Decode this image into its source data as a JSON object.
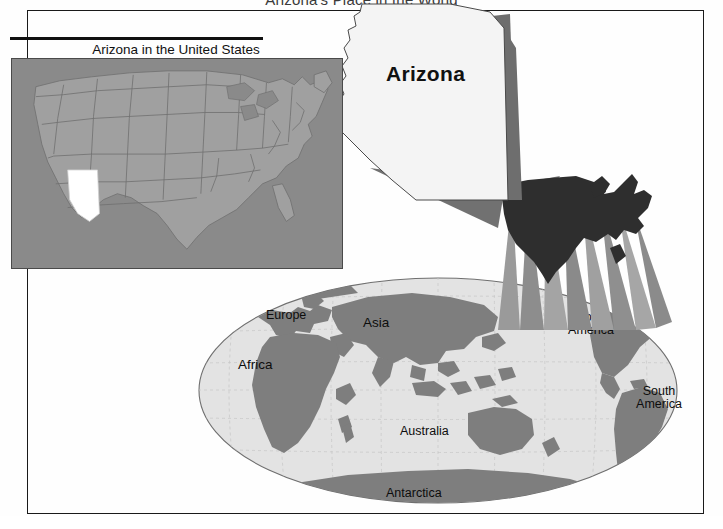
{
  "figure": {
    "title": "Arizona's Place in the World",
    "type": "locator-map-diagram"
  },
  "inset": {
    "caption": "Arizona in the United States",
    "highlighted_state": "Arizona",
    "background_color": "#8a8a8a",
    "land_color": "#9c9c9c",
    "highlight_color": "#ffffff",
    "border_color": "#4a4a4a"
  },
  "callout": {
    "state_label": "Arizona",
    "shape_fill": "#f2f2f2",
    "shadow_fill": "#6e6e6e"
  },
  "world": {
    "ocean_color": "#e3e3e3",
    "land_color": "#7e7e7e",
    "outline_color": "#6f6f6f",
    "graticule_color": "#c2c2c2",
    "labels": [
      {
        "name": "Europe"
      },
      {
        "name": "Asia"
      },
      {
        "name": "Africa"
      },
      {
        "name": "Australia"
      },
      {
        "name": "North\nAmerica",
        "line1": "North",
        "line2": "America"
      },
      {
        "name": "South\nAmerica",
        "line1": "South",
        "line2": "America"
      },
      {
        "name": "Antarctica"
      }
    ]
  },
  "silhouette": {
    "region": "United States",
    "fill": "#2e2e2e"
  },
  "frame": {
    "border_color": "#1a1a1a",
    "shadow_color": "#d8d8d8"
  }
}
